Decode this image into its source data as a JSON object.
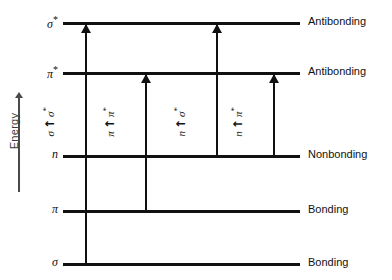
{
  "diagram": {
    "axis": {
      "label": "Energy",
      "direction_icon": "up-arrow-icon"
    },
    "levels": [
      {
        "id": "sigma-star",
        "orbital": "σ",
        "starred": true,
        "right_label": "Antibonding",
        "y": 22
      },
      {
        "id": "pi-star",
        "orbital": "π",
        "starred": true,
        "right_label": "Antibonding",
        "y": 72
      },
      {
        "id": "n",
        "orbital": "n",
        "starred": false,
        "right_label": "Nonbonding",
        "y": 155
      },
      {
        "id": "pi",
        "orbital": "π",
        "starred": false,
        "right_label": "Bonding",
        "y": 210
      },
      {
        "id": "sigma",
        "orbital": "σ",
        "starred": false,
        "right_label": "Bonding",
        "y": 263
      }
    ],
    "transitions": [
      {
        "id": "sigma-to-sigma-star",
        "from": "σ",
        "from_starred": false,
        "to": "σ",
        "to_starred": true,
        "label": "σ → σ*",
        "x": 85,
        "from_level": "sigma",
        "to_level": "sigma-star"
      },
      {
        "id": "pi-to-pi-star",
        "from": "π",
        "from_starred": false,
        "to": "π",
        "to_starred": true,
        "label": "π → π*",
        "x": 145,
        "from_level": "pi",
        "to_level": "pi-star"
      },
      {
        "id": "n-to-sigma-star",
        "from": "n",
        "from_starred": false,
        "to": "σ",
        "to_starred": true,
        "label": "n → σ*",
        "x": 216,
        "from_level": "n",
        "to_level": "sigma-star"
      },
      {
        "id": "n-to-pi-star",
        "from": "n",
        "from_starred": false,
        "to": "π",
        "to_starred": true,
        "label": "n → π*",
        "x": 273,
        "from_level": "n",
        "to_level": "pi-star"
      }
    ],
    "colors": {
      "line": "#111111",
      "axis": "#4a4a4a",
      "background": "#ffffff"
    }
  },
  "chart_data": {
    "type": "diagram",
    "ylabel": "Energy",
    "categories": [
      "σ",
      "π",
      "n",
      "π*",
      "σ*"
    ],
    "level_classes": [
      "Bonding",
      "Bonding",
      "Nonbonding",
      "Antibonding",
      "Antibonding"
    ],
    "transitions": [
      "σ → σ*",
      "π → π*",
      "n → σ*",
      "n → π*"
    ]
  }
}
